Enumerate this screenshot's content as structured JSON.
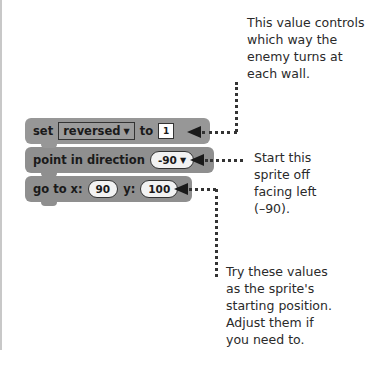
{
  "blocks": {
    "set": {
      "label": "set",
      "variable": "reversed",
      "to_label": "to",
      "value": "1"
    },
    "point": {
      "label": "point in direction",
      "value": "-90"
    },
    "goto": {
      "label_x": "go to x:",
      "x_value": "90",
      "label_y": "y:",
      "y_value": "100"
    }
  },
  "annotations": {
    "reversed_note": [
      "This value controls",
      "which way the",
      "enemy turns at",
      "each wall."
    ],
    "direction_note": [
      "Start this",
      "sprite off",
      "facing left",
      "(–90)."
    ],
    "position_note": [
      "Try these values",
      "as the sprite's",
      "starting position.",
      "Adjust them if",
      "you need to."
    ]
  },
  "icons": {
    "dropdown": "▼"
  },
  "colors": {
    "block": "#8f8f8f",
    "text": "#2a2a2a",
    "pointer": "#1a1a1a"
  }
}
